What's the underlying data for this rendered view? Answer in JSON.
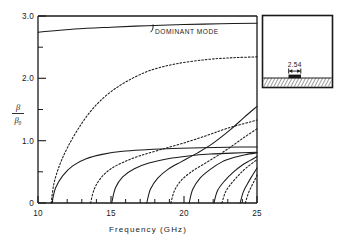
{
  "chart_data": {
    "type": "line",
    "title": "",
    "xlabel": "Frequency  (GHz)",
    "ylabel": "β/β₀",
    "ylabel_num": "β",
    "ylabel_den": "β₀",
    "xlim": [
      10,
      25
    ],
    "ylim": [
      0,
      3.0
    ],
    "grid": false,
    "legend": "none",
    "xticks": [
      10,
      15,
      20,
      25
    ],
    "xtick_labels": [
      "10",
      "15",
      "20",
      "25"
    ],
    "xticks_minor": [
      11,
      12,
      13,
      14,
      16,
      17,
      18,
      19,
      21,
      22,
      23,
      24
    ],
    "yticks": [
      0,
      1.0,
      2.0,
      3.0
    ],
    "ytick_labels": [
      "0",
      "1.0",
      "2.0",
      "3.0"
    ],
    "yticks_minor": [
      0.5,
      1.5,
      2.5
    ],
    "annotations": [
      {
        "text": "DOMINANT MODE",
        "x": 17.4,
        "y": 2.72,
        "leader": true
      }
    ],
    "series": [
      {
        "name": "dominant-mode",
        "style": "solid",
        "cutoff": 10.0,
        "points": [
          [
            10.0,
            2.74
          ],
          [
            12.5,
            2.79
          ],
          [
            15.0,
            2.82
          ],
          [
            17.5,
            2.845
          ],
          [
            20.0,
            2.862
          ],
          [
            22.5,
            2.875
          ],
          [
            25.0,
            2.885
          ]
        ]
      },
      {
        "name": "mode-2-dashed",
        "style": "dashed",
        "cutoff": 10.9,
        "points": [
          [
            10.9,
            0.0
          ],
          [
            11.1,
            0.32
          ],
          [
            11.5,
            0.62
          ],
          [
            12.0,
            0.88
          ],
          [
            12.7,
            1.17
          ],
          [
            13.6,
            1.47
          ],
          [
            14.7,
            1.73
          ],
          [
            16.0,
            1.94
          ],
          [
            17.6,
            2.12
          ],
          [
            19.4,
            2.23
          ],
          [
            21.5,
            2.3
          ],
          [
            23.3,
            2.33
          ],
          [
            25.0,
            2.345
          ]
        ]
      },
      {
        "name": "mode-3-solid",
        "style": "solid",
        "cutoff": 10.95,
        "points": [
          [
            10.95,
            0.0
          ],
          [
            11.2,
            0.24
          ],
          [
            11.7,
            0.44
          ],
          [
            12.4,
            0.6
          ],
          [
            13.3,
            0.71
          ],
          [
            14.4,
            0.78
          ],
          [
            15.8,
            0.83
          ],
          [
            17.4,
            0.855
          ],
          [
            19.2,
            0.875
          ],
          [
            21.2,
            0.885
          ],
          [
            23.0,
            0.895
          ],
          [
            25.0,
            0.9
          ]
        ]
      },
      {
        "name": "mode-4-dashed",
        "style": "dashed",
        "cutoff": 13.6,
        "points": [
          [
            13.6,
            0.0
          ],
          [
            13.85,
            0.22
          ],
          [
            14.3,
            0.4
          ],
          [
            15.0,
            0.55
          ],
          [
            15.9,
            0.66
          ],
          [
            17.0,
            0.76
          ],
          [
            18.3,
            0.85
          ],
          [
            19.8,
            0.95
          ],
          [
            21.4,
            1.07
          ],
          [
            23.0,
            1.2
          ],
          [
            25.0,
            1.33
          ]
        ]
      },
      {
        "name": "mode-5-solid",
        "style": "solid",
        "cutoff": 15.05,
        "points": [
          [
            15.05,
            0.0
          ],
          [
            15.3,
            0.24
          ],
          [
            15.8,
            0.42
          ],
          [
            16.6,
            0.55
          ],
          [
            17.6,
            0.64
          ],
          [
            18.9,
            0.71
          ],
          [
            20.3,
            0.755
          ],
          [
            21.8,
            0.785
          ],
          [
            23.3,
            0.8
          ],
          [
            25.0,
            0.815
          ]
        ]
      },
      {
        "name": "mode-6-solid-rising",
        "style": "solid",
        "cutoff": 17.45,
        "points": [
          [
            17.45,
            0.0
          ],
          [
            17.7,
            0.22
          ],
          [
            18.2,
            0.4
          ],
          [
            18.9,
            0.54
          ],
          [
            19.8,
            0.66
          ],
          [
            20.9,
            0.8
          ],
          [
            22.0,
            0.96
          ],
          [
            23.2,
            1.18
          ],
          [
            24.1,
            1.37
          ],
          [
            25.0,
            1.55
          ]
        ]
      },
      {
        "name": "mode-7-dashed",
        "style": "dashed",
        "cutoff": 19.1,
        "points": [
          [
            19.1,
            0.0
          ],
          [
            19.35,
            0.2
          ],
          [
            19.8,
            0.36
          ],
          [
            20.5,
            0.5
          ],
          [
            21.4,
            0.63
          ],
          [
            22.3,
            0.76
          ],
          [
            23.2,
            0.9
          ],
          [
            24.1,
            1.05
          ],
          [
            25.0,
            1.19
          ]
        ]
      },
      {
        "name": "mode-8-solid",
        "style": "solid",
        "cutoff": 20.35,
        "points": [
          [
            20.35,
            0.0
          ],
          [
            20.6,
            0.22
          ],
          [
            21.1,
            0.4
          ],
          [
            21.8,
            0.54
          ],
          [
            22.6,
            0.66
          ],
          [
            23.4,
            0.73
          ],
          [
            24.2,
            0.775
          ],
          [
            25.0,
            0.805
          ]
        ]
      },
      {
        "name": "mode-9-solid",
        "style": "solid",
        "cutoff": 22.05,
        "points": [
          [
            22.05,
            0.0
          ],
          [
            22.3,
            0.2
          ],
          [
            22.8,
            0.36
          ],
          [
            23.4,
            0.5
          ],
          [
            24.0,
            0.61
          ],
          [
            24.5,
            0.68
          ],
          [
            25.0,
            0.745
          ]
        ]
      },
      {
        "name": "mode-10-dashed",
        "style": "dashed",
        "cutoff": 22.6,
        "points": [
          [
            22.6,
            0.0
          ],
          [
            22.85,
            0.18
          ],
          [
            23.3,
            0.33
          ],
          [
            23.8,
            0.46
          ],
          [
            24.3,
            0.57
          ],
          [
            25.0,
            0.695
          ]
        ]
      },
      {
        "name": "mode-11-solid",
        "style": "solid",
        "cutoff": 23.85,
        "points": [
          [
            23.85,
            0.0
          ],
          [
            24.05,
            0.17
          ],
          [
            24.35,
            0.31
          ],
          [
            24.65,
            0.43
          ],
          [
            25.0,
            0.56
          ]
        ]
      },
      {
        "name": "mode-12-dashed",
        "style": "dashed",
        "cutoff": 24.2,
        "points": [
          [
            24.2,
            0.0
          ],
          [
            24.4,
            0.15
          ],
          [
            24.65,
            0.28
          ],
          [
            24.85,
            0.37
          ],
          [
            25.0,
            0.45
          ]
        ]
      }
    ]
  },
  "inset": {
    "name": "waveguide-cross-section",
    "dimension_label": "2.54"
  }
}
